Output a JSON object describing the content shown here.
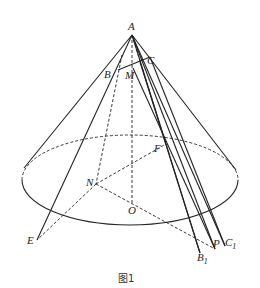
{
  "figure": {
    "caption": "图1",
    "labels": {
      "A": "A",
      "B": "B",
      "C": "C",
      "M": "M",
      "F": "F",
      "N": "N",
      "O": "O",
      "E": "E",
      "P": "P",
      "B1": "B",
      "B1_sub": "1",
      "C1": "C",
      "C1_sub": "1"
    }
  }
}
